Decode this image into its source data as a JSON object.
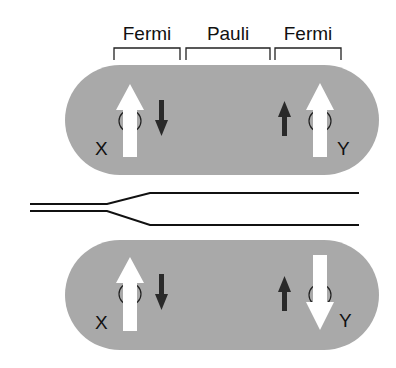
{
  "diagram": {
    "top_labels": [
      "Fermi",
      "Pauli",
      "Fermi"
    ],
    "colors": {
      "capsule_fill": "#a9a9a9",
      "large_arrow": "#ffffff",
      "small_arrow": "#2a2a2a",
      "line": "#111111",
      "background": "#ffffff"
    },
    "top_capsule": {
      "left_label": "X",
      "right_label": "Y",
      "left_large_arrow": "up",
      "left_small_arrow": "down",
      "right_small_arrow": "up",
      "right_large_arrow": "up"
    },
    "bottom_capsule": {
      "left_label": "X",
      "right_label": "Y",
      "left_large_arrow": "up",
      "left_small_arrow": "down",
      "right_small_arrow": "up",
      "right_large_arrow": "down"
    },
    "splitting_lines": {
      "description": "two nearly degenerate levels splitting into upper and lower levels"
    }
  }
}
